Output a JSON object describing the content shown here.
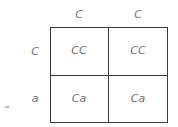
{
  "punnett": {
    "columns": [
      "C",
      "C"
    ],
    "rows": [
      "C",
      "a"
    ],
    "cells": [
      [
        "CC",
        "CC"
      ],
      [
        "Ca",
        "Ca"
      ]
    ]
  },
  "corner_mark": "≈"
}
